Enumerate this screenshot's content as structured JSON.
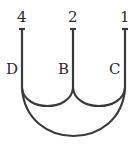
{
  "diagram": {
    "type": "loop-wiring",
    "terminals": [
      {
        "number": "4",
        "letter": "D",
        "x": 22
      },
      {
        "number": "2",
        "letter": "B",
        "x": 73
      },
      {
        "number": "1",
        "letter": "C",
        "x": 125
      }
    ],
    "stroke_color": "#3a3a3a",
    "background": "#ffffff"
  }
}
